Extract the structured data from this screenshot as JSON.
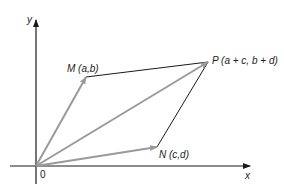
{
  "diagram": {
    "axes": {
      "x_label": "x",
      "y_label": "y",
      "origin_label": "0"
    },
    "points": {
      "O": {
        "label": "0",
        "px": [
          36,
          166
        ]
      },
      "M": {
        "label": "M (a,b)",
        "name": "M",
        "coords": "(a,b)",
        "px": [
          86,
          77
        ]
      },
      "N": {
        "label": "N (c,d)",
        "name": "N",
        "coords": "(c,d)",
        "px": [
          157,
          147
        ]
      },
      "P": {
        "label": "P (a + c,  b + d)",
        "name": "P",
        "coords": "(a + c,  b + d)",
        "px": [
          208,
          62
        ]
      }
    },
    "vectors": [
      {
        "from": "O",
        "to": "M",
        "color": "#9a9a9a",
        "arrow": true
      },
      {
        "from": "O",
        "to": "N",
        "color": "#9a9a9a",
        "arrow": true
      },
      {
        "from": "O",
        "to": "P",
        "color": "#9a9a9a",
        "arrow": true
      }
    ],
    "edges": [
      {
        "from": "M",
        "to": "P",
        "color": "#1a1a1a"
      },
      {
        "from": "N",
        "to": "P",
        "color": "#1a1a1a"
      }
    ],
    "colors": {
      "vector": "#9a9a9a",
      "edge": "#1a1a1a",
      "axis": "#1a1a1a"
    }
  }
}
